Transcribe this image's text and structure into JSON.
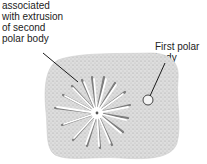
{
  "labels": {
    "left": [
      "associated",
      "with extrusion",
      "of second",
      "polar body"
    ],
    "right": [
      "First polar",
      "body"
    ]
  },
  "colors": {
    "text": "#222222",
    "cell_fill": "#d9d9d9",
    "stipple": "#9a9a9a",
    "aster": "#ffffff",
    "aster_shadow": "#6e6e6e",
    "leader_line": "#1a1a1a"
  }
}
